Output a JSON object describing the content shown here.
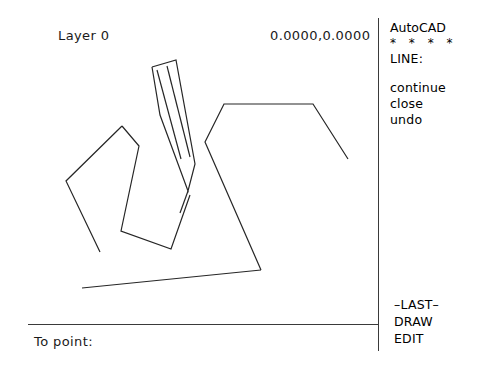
{
  "app": {
    "name": "AutoCAD",
    "screen_width": 477,
    "screen_height": 367,
    "background_color": "#ffffff",
    "ink_color": "#262626"
  },
  "status_bar": {
    "layer_label": "Layer 0",
    "coordinates": "0.0000,0.0000"
  },
  "command_prompt": {
    "text": "To point:"
  },
  "side_menu": {
    "title": "AutoCAD",
    "separator": "* * * *",
    "active_command": "LINE:",
    "options": [
      {
        "label": "continue"
      },
      {
        "label": "close"
      },
      {
        "label": "undo"
      }
    ],
    "bottom_options": [
      {
        "label": "–LAST–"
      },
      {
        "label": "DRAW"
      },
      {
        "label": "EDIT"
      }
    ]
  },
  "drawing": {
    "stroke_color": "#262626",
    "stroke_width": 1.2,
    "entities": [
      {
        "name": "left-polyline",
        "type": "polyline",
        "points": "122,126 66,181 100,252"
      },
      {
        "name": "middle-quadrilateral",
        "type": "polyline",
        "points": "122,126 139,146 121,231 171,249 190,195"
      },
      {
        "name": "right-polyline",
        "type": "polyline",
        "points": "348,159 313,104 224,104 205,142 261,270"
      },
      {
        "name": "bottom-diagonal-line",
        "type": "line",
        "points": "261,270 82,288"
      },
      {
        "name": "pencil-cursor-body",
        "type": "polyline",
        "points": "152,67 176,60 195,164 188,191 160,115"
      },
      {
        "name": "pencil-cursor-inner-left",
        "type": "polyline",
        "points": "157,70 181,158"
      },
      {
        "name": "pencil-cursor-inner-right",
        "type": "polyline",
        "points": "167,66 190,156"
      },
      {
        "name": "pencil-cursor-tip-line",
        "type": "line",
        "points": "188,191 180,213"
      }
    ]
  }
}
